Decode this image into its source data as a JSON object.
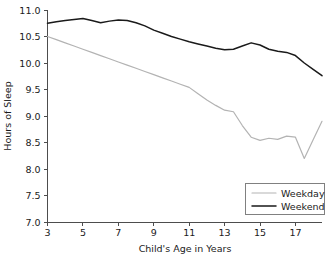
{
  "chart_data": {
    "type": "line",
    "title": "",
    "xlabel": "Child's Age in Years",
    "ylabel": "Hours of Sleep",
    "xlim": [
      3,
      18.5
    ],
    "ylim": [
      7.0,
      11.0
    ],
    "grid": false,
    "legend_position": "bottom-right",
    "xticks": [
      3,
      5,
      7,
      9,
      11,
      13,
      15,
      17
    ],
    "xtick_labels": [
      "3",
      "5",
      "7",
      "9",
      "11",
      "13",
      "15",
      "17"
    ],
    "yticks": [
      7.0,
      7.5,
      8.0,
      8.5,
      9.0,
      9.5,
      10.0,
      10.5,
      11.0
    ],
    "ytick_labels": [
      "7.0",
      "7.5",
      "8.0",
      "8.5",
      "9.0",
      "9.5",
      "10.0",
      "10.5",
      "11.0"
    ],
    "x": [
      3,
      3.5,
      4,
      4.5,
      5,
      5.5,
      6,
      6.5,
      7,
      7.5,
      8,
      8.5,
      9,
      9.5,
      10,
      10.5,
      11,
      11.5,
      12,
      12.5,
      13,
      13.5,
      14,
      14.5,
      15,
      15.5,
      16,
      16.5,
      17,
      17.5,
      18,
      18.5
    ],
    "series": [
      {
        "name": "Weekday",
        "color": "#b3b3b3",
        "values": [
          10.5,
          10.44,
          10.38,
          10.32,
          10.26,
          10.2,
          10.14,
          10.08,
          10.02,
          9.96,
          9.9,
          9.84,
          9.78,
          9.72,
          9.66,
          9.6,
          9.54,
          9.42,
          9.3,
          9.2,
          9.11,
          9.08,
          8.82,
          8.6,
          8.54,
          8.58,
          8.56,
          8.62,
          8.6,
          8.2,
          8.55,
          8.9
        ]
      },
      {
        "name": "Weekend",
        "color": "#1a1a1a",
        "values": [
          10.75,
          10.78,
          10.8,
          10.82,
          10.84,
          10.8,
          10.76,
          10.79,
          10.81,
          10.8,
          10.76,
          10.7,
          10.62,
          10.56,
          10.5,
          10.45,
          10.4,
          10.36,
          10.32,
          10.28,
          10.25,
          10.26,
          10.32,
          10.38,
          10.34,
          10.26,
          10.22,
          10.2,
          10.14,
          10.0,
          9.88,
          9.76
        ]
      }
    ]
  },
  "legend": {
    "entries": [
      {
        "label": "Weekday",
        "color": "#b3b3b3"
      },
      {
        "label": "Weekend",
        "color": "#1a1a1a"
      }
    ]
  }
}
